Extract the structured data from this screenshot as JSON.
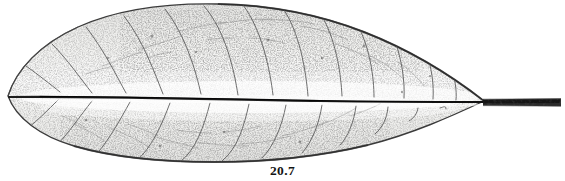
{
  "figure": {
    "caption": "20.7",
    "type": "botanical halftone plate",
    "background_color": "#ffffff",
    "ink_color": "#2b2b2b",
    "midrib_color": "#1a1a1a",
    "vein_color": "#555555",
    "margin_color": "#3a3a3a",
    "lamina_fill": "#f1f1ef",
    "petiole_color": "#2a2a2a"
  },
  "specimen": {
    "outline_label": "leaf-lamina-outline",
    "apex_label": "leaf-apex",
    "base_label": "leaf-base",
    "midrib_label": "leaf-midrib",
    "petiole_label": "leaf-petiole",
    "shape": "elliptic-lanceolate",
    "apex_side": "left",
    "petiole_side": "right",
    "secondary_vein_pairs": 12,
    "bounds": {
      "leaf_left_x": 8,
      "leaf_right_x": 487,
      "leaf_top_y": 4,
      "leaf_bottom_y": 162,
      "petiole_start_x": 483,
      "petiole_end_x": 561,
      "petiole_y": 102
    }
  },
  "veins": {
    "upper_half": [
      {
        "id": "u1",
        "origin_x": 60,
        "tip_x": 26,
        "tip_y": 66
      },
      {
        "id": "u2",
        "origin_x": 92,
        "tip_x": 52,
        "tip_y": 44
      },
      {
        "id": "u3",
        "origin_x": 126,
        "tip_x": 86,
        "tip_y": 27
      },
      {
        "id": "u4",
        "origin_x": 163,
        "tip_x": 124,
        "tip_y": 16
      },
      {
        "id": "u5",
        "origin_x": 201,
        "tip_x": 165,
        "tip_y": 9
      },
      {
        "id": "u6",
        "origin_x": 238,
        "tip_x": 204,
        "tip_y": 6
      },
      {
        "id": "u7",
        "origin_x": 273,
        "tip_x": 243,
        "tip_y": 5
      },
      {
        "id": "u8",
        "origin_x": 308,
        "tip_x": 282,
        "tip_y": 7
      },
      {
        "id": "u9",
        "origin_x": 342,
        "tip_x": 320,
        "tip_y": 13
      },
      {
        "id": "u10",
        "origin_x": 374,
        "tip_x": 356,
        "tip_y": 22
      },
      {
        "id": "u11",
        "origin_x": 404,
        "tip_x": 392,
        "tip_y": 34
      },
      {
        "id": "u12",
        "origin_x": 433,
        "tip_x": 425,
        "tip_y": 50
      }
    ],
    "lower_half": [
      {
        "id": "l1",
        "origin_x": 58,
        "tip_x": 28,
        "tip_y": 128
      },
      {
        "id": "l2",
        "origin_x": 92,
        "tip_x": 56,
        "tip_y": 146
      },
      {
        "id": "l3",
        "origin_x": 130,
        "tip_x": 94,
        "tip_y": 157
      },
      {
        "id": "l4",
        "origin_x": 170,
        "tip_x": 136,
        "tip_y": 161
      },
      {
        "id": "l5",
        "origin_x": 210,
        "tip_x": 180,
        "tip_y": 162
      },
      {
        "id": "l6",
        "origin_x": 249,
        "tip_x": 222,
        "tip_y": 161
      },
      {
        "id": "l7",
        "origin_x": 286,
        "tip_x": 262,
        "tip_y": 158
      },
      {
        "id": "l8",
        "origin_x": 322,
        "tip_x": 302,
        "tip_y": 153
      },
      {
        "id": "l9",
        "origin_x": 356,
        "tip_x": 340,
        "tip_y": 145
      },
      {
        "id": "l10",
        "origin_x": 388,
        "tip_x": 375,
        "tip_y": 134
      },
      {
        "id": "l11",
        "origin_x": 418,
        "tip_x": 409,
        "tip_y": 121
      },
      {
        "id": "l12",
        "origin_x": 446,
        "tip_x": 440,
        "tip_y": 108
      }
    ]
  }
}
